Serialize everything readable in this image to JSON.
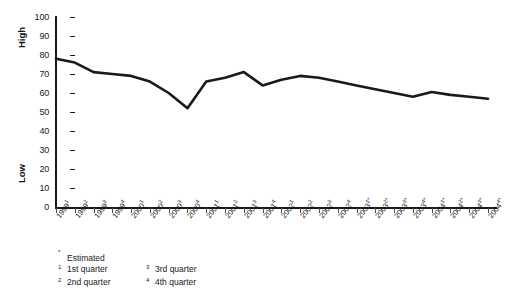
{
  "chart_data": {
    "type": "line",
    "title": "",
    "xlabel": "",
    "ylabel": "",
    "ylim": [
      0,
      100
    ],
    "ytick_values": [
      100,
      90,
      80,
      70,
      60,
      50,
      40,
      30,
      20,
      10,
      0
    ],
    "grid": false,
    "legend": "none",
    "axis_group_labels": {
      "top": "High",
      "bottom": "Low"
    },
    "categories": [
      "1999¹",
      "1999²",
      "1999³",
      "1999⁴",
      "2000¹",
      "2000²",
      "2000³",
      "2000⁴",
      "2001¹",
      "2001²",
      "2001³",
      "2001⁴",
      "2002¹",
      "2002²",
      "2002³",
      "2002⁴",
      "2003¹*",
      "2003²*",
      "2003³*",
      "2003⁴*",
      "2004¹*",
      "2004²*",
      "2004³*",
      "2004⁴*"
    ],
    "category_parts": [
      {
        "year": "1999",
        "sup": "1",
        "est": ""
      },
      {
        "year": "1999",
        "sup": "2",
        "est": ""
      },
      {
        "year": "1999",
        "sup": "3",
        "est": ""
      },
      {
        "year": "1999",
        "sup": "4",
        "est": ""
      },
      {
        "year": "2000",
        "sup": "1",
        "est": ""
      },
      {
        "year": "2000",
        "sup": "2",
        "est": ""
      },
      {
        "year": "2000",
        "sup": "3",
        "est": ""
      },
      {
        "year": "2000",
        "sup": "4",
        "est": ""
      },
      {
        "year": "2001",
        "sup": "1",
        "est": ""
      },
      {
        "year": "2001",
        "sup": "2",
        "est": ""
      },
      {
        "year": "2001",
        "sup": "3",
        "est": ""
      },
      {
        "year": "2001",
        "sup": "4",
        "est": ""
      },
      {
        "year": "2002",
        "sup": "1",
        "est": ""
      },
      {
        "year": "2002",
        "sup": "2",
        "est": ""
      },
      {
        "year": "2002",
        "sup": "3",
        "est": ""
      },
      {
        "year": "2002",
        "sup": "4",
        "est": ""
      },
      {
        "year": "2003",
        "sup": "1",
        "est": "*"
      },
      {
        "year": "2003",
        "sup": "2",
        "est": "*"
      },
      {
        "year": "2003",
        "sup": "3",
        "est": "*"
      },
      {
        "year": "2003",
        "sup": "4",
        "est": "*"
      },
      {
        "year": "2004",
        "sup": "1",
        "est": "*"
      },
      {
        "year": "2004",
        "sup": "2",
        "est": "*"
      },
      {
        "year": "2004",
        "sup": "3",
        "est": "*"
      },
      {
        "year": "2004",
        "sup": "4",
        "est": "*"
      }
    ],
    "series": [
      {
        "name": "Index",
        "color": "#1a1a1a",
        "values": [
          78,
          76,
          71,
          70,
          69,
          66,
          60,
          52,
          66,
          68,
          71,
          64,
          67,
          69,
          68,
          66,
          64,
          62,
          60,
          58,
          60.5,
          59,
          58,
          57
        ]
      }
    ]
  },
  "footnotes": {
    "estimated": "Estimated",
    "estimated_mark": "*",
    "items": [
      {
        "mark": "1",
        "text": "1st quarter"
      },
      {
        "mark": "3",
        "text": "3rd quarter"
      },
      {
        "mark": "2",
        "text": "2nd quarter"
      },
      {
        "mark": "4",
        "text": "4th quarter"
      }
    ]
  }
}
